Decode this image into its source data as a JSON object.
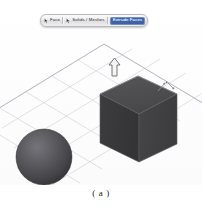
{
  "figure": {
    "caption": "( a )"
  },
  "toolbar": {
    "name": "selection-filter-toolbar",
    "items": [
      {
        "id": "face",
        "label": "Face",
        "icon": "cursor-face-icon",
        "selected": false
      },
      {
        "id": "solids-meshes",
        "label": "Solids / Meshes",
        "icon": "cursor-solid-icon",
        "selected": false
      },
      {
        "id": "extrude-faces",
        "label": "Extrude Faces",
        "icon": "none",
        "selected": true
      }
    ]
  },
  "viewport": {
    "name": "3d-viewport",
    "background_color": "#fdfdfd",
    "grid": {
      "color": "#c9ccd2",
      "style": "isometric-plane",
      "visible": true,
      "rows": 5,
      "cols": 9
    },
    "objects": [
      {
        "id": "cube",
        "type": "box",
        "label": "Cube",
        "top_face_color": "#4b4b4e",
        "left_face_color": "#3a3a3c",
        "right_face_color": "#434346",
        "edge_color": "#6d6d72",
        "selected": true
      },
      {
        "id": "sphere",
        "type": "sphere",
        "label": "Sphere",
        "fill_color": "#58585b",
        "shade_color": "#3c3c3f",
        "highlight_color": "#6e6e72",
        "selected": false
      }
    ],
    "gizmo": {
      "id": "extrude-arrow",
      "type": "arrow-up",
      "label": "Extrude direction",
      "color": "#7a7a80"
    },
    "marker": {
      "id": "dimension-marker",
      "label": "axis marker",
      "color": "#8d8d93"
    }
  },
  "colors": {
    "accent": "#3c63a8",
    "grid": "#c9ccd2",
    "object_dark": "#3a3a3c",
    "page_background": "#ffffff"
  }
}
